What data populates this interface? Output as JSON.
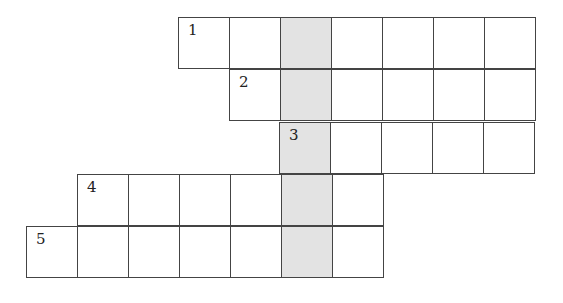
{
  "puzzle": {
    "type": "crossword",
    "cell_size": 51,
    "shaded_color": "#e3e3e3",
    "shaded_column_x": 279,
    "rows": [
      {
        "number": "1",
        "x": 178,
        "y": 17,
        "cells": 7
      },
      {
        "number": "2",
        "x": 229,
        "y": 69,
        "cells": 6
      },
      {
        "number": "3",
        "x": 279,
        "y": 122,
        "cells": 5
      },
      {
        "number": "4",
        "x": 77,
        "y": 174,
        "cells": 6
      },
      {
        "number": "5",
        "x": 26,
        "y": 226,
        "cells": 7
      }
    ]
  }
}
